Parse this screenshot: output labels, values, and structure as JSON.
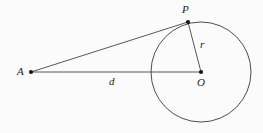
{
  "figure": {
    "kind": "geometry-diagram",
    "background_color": "#fbfbfb",
    "stroke_color": "#3a3a3a",
    "label_color": "#1b1b1b",
    "width": 263,
    "height": 133
  },
  "points": [
    {
      "id": "A",
      "label": "A",
      "x": 31,
      "y": 72,
      "dot": true,
      "dot_radius": 2.1
    },
    {
      "id": "P",
      "label": "P",
      "x": 188,
      "y": 22,
      "dot": true,
      "dot_radius": 2.1
    },
    {
      "id": "O",
      "label": "O",
      "x": 201,
      "y": 72,
      "dot": true,
      "dot_radius": 2.1
    }
  ],
  "circle": {
    "center_x": 201,
    "center_y": 72,
    "radius": 50,
    "stroke_width": 0.9
  },
  "segments": [
    {
      "id": "AP",
      "from": "A",
      "to": "P",
      "label": "",
      "stroke_width": 0.8
    },
    {
      "id": "AO",
      "from": "A",
      "to": "O",
      "label": "d",
      "stroke_width": 0.8
    },
    {
      "id": "OP",
      "from": "O",
      "to": "P",
      "label": "r",
      "stroke_width": 0.8
    }
  ],
  "labels": {
    "point_p": "P",
    "point_a": "A",
    "point_o": "O",
    "distance_d": "d",
    "radius_r": "r"
  }
}
